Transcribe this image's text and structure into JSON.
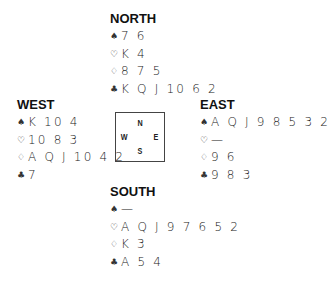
{
  "suit_symbols": {
    "spades": "♠",
    "hearts": "♡",
    "diamonds": "♢",
    "clubs": "♣"
  },
  "hands": {
    "north": {
      "label": "NORTH",
      "spades": "7 6",
      "hearts": "K 4",
      "diamonds": "8 7 5",
      "clubs": "K Q J 10 6 2"
    },
    "west": {
      "label": "WEST",
      "spades": "K 10 4",
      "hearts": "10 8 3",
      "diamonds": "A Q J 10 4 2",
      "clubs": "7"
    },
    "east": {
      "label": "EAST",
      "spades": "A Q J 9 8 5 3 2",
      "hearts": "—",
      "diamonds": "9 6",
      "clubs": "9 8 3"
    },
    "south": {
      "label": "SOUTH",
      "spades": "—",
      "hearts": "A Q J 9 7 6 5 2",
      "diamonds": "K 3",
      "clubs": "A 5 4"
    }
  },
  "compass": {
    "n": "N",
    "s": "S",
    "w": "W",
    "e": "E"
  }
}
